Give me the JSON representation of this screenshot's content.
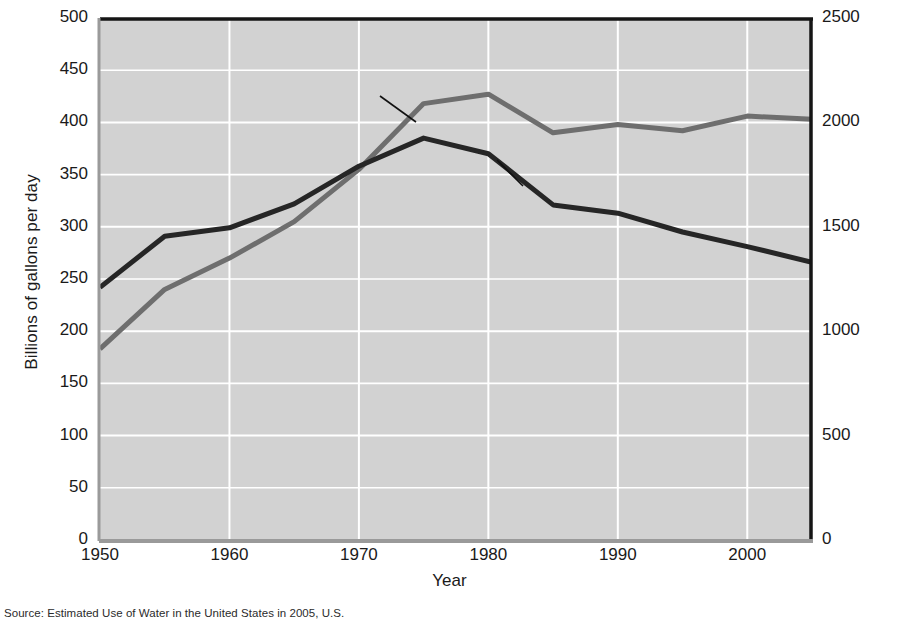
{
  "chart_data": {
    "type": "line",
    "title": "",
    "xlabel": "Year",
    "ylabel": "Billions of gallons per day",
    "ylabel_right": "Gallons per person per day",
    "xlim": [
      1950,
      2005
    ],
    "ylim": [
      0,
      500
    ],
    "ylim_right": [
      0,
      2500
    ],
    "xticks": [
      1950,
      1960,
      1970,
      1980,
      1990,
      2000
    ],
    "xtick_labels": [
      "1950",
      "1960",
      "1970",
      "1980",
      "1990",
      "2000"
    ],
    "yticks": [
      0,
      50,
      100,
      150,
      200,
      250,
      300,
      350,
      400,
      450,
      500
    ],
    "ytick_labels": [
      "0",
      "50",
      "100",
      "150",
      "200",
      "250",
      "300",
      "350",
      "400",
      "450",
      "500"
    ],
    "yticks_right": [
      0,
      500,
      1000,
      1500,
      2000,
      2500
    ],
    "ytick_labels_right": [
      "0",
      "500",
      "1000",
      "1500",
      "2000",
      "2500"
    ],
    "grid": true,
    "grid_color": "#ffffff",
    "plot_background": "#d2d2d2",
    "legend": "annotations",
    "x": [
      1950,
      1955,
      1960,
      1965,
      1970,
      1975,
      1980,
      1985,
      1990,
      1995,
      2000,
      2005
    ],
    "series": [
      {
        "name": "Total water use",
        "axis": "left",
        "color": "#6e6e6e",
        "units": "Billions of gallons per day",
        "values": [
          183,
          240,
          270,
          305,
          355,
          418,
          427,
          390,
          398,
          392,
          406,
          403
        ]
      },
      {
        "name": "Per capita water use",
        "axis": "right",
        "color": "#262626",
        "units": "Gallons per person per day",
        "values_right": [
          1210,
          1455,
          1495,
          1610,
          1790,
          1925,
          1850,
          1605,
          1565,
          1475,
          1405,
          1330
        ],
        "values": [
          242,
          291,
          299,
          322,
          358,
          385,
          370,
          321,
          313,
          295,
          281,
          266
        ]
      }
    ],
    "annotations": [
      {
        "text": "Total water use",
        "x": 1961,
        "y": 432
      },
      {
        "text": "Per capita water use",
        "x": 1982,
        "y": 345
      }
    ]
  },
  "source": {
    "text": "Source: Estimated Use of Water in the United States in 2005, U.S."
  }
}
